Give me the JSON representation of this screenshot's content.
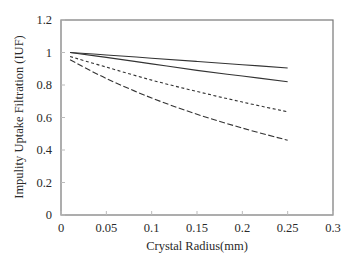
{
  "chart_data": {
    "type": "line",
    "title": "",
    "xlabel": "Crystal Radius(mm)",
    "ylabel": "Impulity Uptake Filtration (IUF)",
    "xlim": [
      0,
      0.3
    ],
    "ylim": [
      0,
      1.2
    ],
    "xticks": [
      0,
      0.05,
      0.1,
      0.15,
      0.2,
      0.25,
      0.3
    ],
    "xtick_labels": [
      "0",
      "0.05",
      "0.1",
      "0.15",
      "0.2",
      "0.25",
      "0.3"
    ],
    "yticks": [
      0,
      0.2,
      0.4,
      0.6,
      0.8,
      1.0,
      1.2
    ],
    "ytick_labels": [
      "0",
      "0.2",
      "0.4",
      "0.6",
      "0.8",
      "1",
      "1.2"
    ],
    "grid": false,
    "legend": null,
    "x": [
      0.01,
      0.05,
      0.1,
      0.15,
      0.2,
      0.25
    ],
    "series": [
      {
        "name": "curve-1",
        "style": "solid",
        "color": "#333333",
        "values": [
          1.0,
          0.985,
          0.965,
          0.945,
          0.925,
          0.905
        ]
      },
      {
        "name": "curve-2",
        "style": "solid",
        "color": "#333333",
        "values": [
          1.0,
          0.97,
          0.93,
          0.89,
          0.855,
          0.82
        ]
      },
      {
        "name": "curve-3",
        "style": "short-dash",
        "color": "#333333",
        "values": [
          0.975,
          0.91,
          0.83,
          0.76,
          0.695,
          0.635
        ]
      },
      {
        "name": "curve-4",
        "style": "long-dash",
        "color": "#333333",
        "values": [
          0.955,
          0.84,
          0.72,
          0.62,
          0.535,
          0.46
        ]
      }
    ]
  }
}
